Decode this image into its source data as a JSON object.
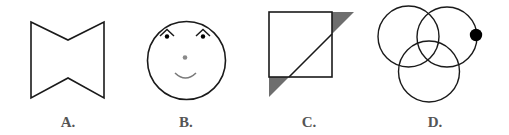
{
  "figures": [
    {
      "id": "A",
      "label": "A.",
      "shape": "bowtie-hexagon",
      "description": "Concave hexagon with V-notches at top and bottom"
    },
    {
      "id": "B",
      "label": "B.",
      "shape": "smiley-face",
      "description": "Circle face with two eyes under chevron brows, gray nose dot and a smile"
    },
    {
      "id": "C",
      "label": "C.",
      "shape": "square-with-diagonal",
      "description": "Square crossed by a 45-degree diagonal line with two gray shaded triangles outside the square"
    },
    {
      "id": "D",
      "label": "D.",
      "shape": "three-circles",
      "description": "Three overlapping circles with a solid black dot on the right circle's edge"
    }
  ],
  "colors": {
    "stroke": "#1a1a1a",
    "shade": "#6e6e6e",
    "nose": "#8a8a8a",
    "smile": "#7a7a7a",
    "dot": "#000000",
    "label": "#555555"
  }
}
